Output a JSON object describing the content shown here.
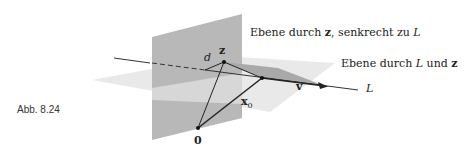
{
  "figure": {
    "caption": "Abb. 8.24",
    "labels": {
      "plane_perp": {
        "prefix": "Ebene durch ",
        "z": "z",
        "mid": ", senkrecht zu ",
        "L": "L"
      },
      "plane_through": {
        "prefix": "Ebene durch ",
        "L": "L",
        "mid": " und ",
        "z": "z"
      },
      "line": "L",
      "point_z": "z",
      "distance": "d",
      "origin": "0",
      "vector_x0": "x",
      "x0_sub": "0",
      "vector_v": "v"
    },
    "colors": {
      "vertical_plane": "#b5b5b5",
      "horizontal_plane": "#e8e8e8",
      "parallelogram": "#a8a8a8",
      "lines": "#222222"
    }
  }
}
